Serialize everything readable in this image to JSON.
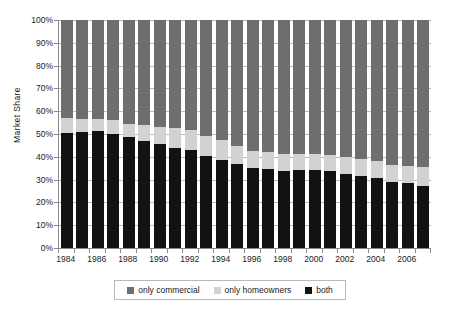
{
  "chart_data": {
    "type": "bar",
    "stacked": true,
    "stack_total": 100,
    "title": "",
    "xlabel": "",
    "ylabel": "Market Share",
    "ylim": [
      0,
      100
    ],
    "ytick_labels": [
      "0%",
      "10%",
      "20%",
      "30%",
      "40%",
      "50%",
      "60%",
      "70%",
      "80%",
      "90%",
      "100%"
    ],
    "ytick_values": [
      0,
      10,
      20,
      30,
      40,
      50,
      60,
      70,
      80,
      90,
      100
    ],
    "grid": true,
    "legend_position": "bottom",
    "categories": [
      "1984",
      "1985",
      "1986",
      "1987",
      "1988",
      "1989",
      "1990",
      "1991",
      "1992",
      "1993",
      "1994",
      "1995",
      "1996",
      "1997",
      "1998",
      "1999",
      "2000",
      "2001",
      "2002",
      "2003",
      "2004",
      "2005",
      "2006",
      "2007"
    ],
    "xtick_labels": [
      "1984",
      "1986",
      "1988",
      "1990",
      "1992",
      "1994",
      "1996",
      "1998",
      "2000",
      "2002",
      "2004",
      "2006"
    ],
    "xtick_categories": [
      "1984",
      "1986",
      "1988",
      "1990",
      "1992",
      "1994",
      "1996",
      "1998",
      "2000",
      "2002",
      "2004",
      "2006"
    ],
    "series": [
      {
        "name": "both",
        "color": "#121212",
        "values": [
          50.5,
          50.8,
          51.2,
          50.2,
          48.6,
          46.8,
          45.5,
          44.0,
          42.8,
          40.5,
          38.8,
          37.0,
          35.2,
          34.8,
          33.8,
          34.3,
          34.3,
          33.6,
          32.5,
          31.7,
          30.7,
          29.0,
          28.3,
          27.4
        ]
      },
      {
        "name": "only homeowners",
        "color": "#d2d2d2",
        "values": [
          6.5,
          5.8,
          5.4,
          5.9,
          5.6,
          7.0,
          7.5,
          8.7,
          8.9,
          8.6,
          8.5,
          7.9,
          7.5,
          7.4,
          7.3,
          7.0,
          7.0,
          7.2,
          7.4,
          7.2,
          7.3,
          7.4,
          7.5,
          8.2
        ]
      },
      {
        "name": "only commercial",
        "color": "#6e6e6e",
        "values": [
          43.0,
          43.4,
          43.4,
          43.9,
          45.8,
          46.2,
          47.0,
          47.3,
          48.3,
          50.9,
          52.7,
          55.1,
          57.3,
          57.8,
          58.9,
          58.7,
          58.7,
          59.2,
          60.1,
          61.1,
          62.0,
          63.6,
          64.2,
          64.4
        ]
      }
    ]
  },
  "legend": {
    "items": [
      {
        "label": "only commercial",
        "color": "#6e6e6e"
      },
      {
        "label": "only homeowners",
        "color": "#d2d2d2"
      },
      {
        "label": "both",
        "color": "#121212"
      }
    ]
  }
}
